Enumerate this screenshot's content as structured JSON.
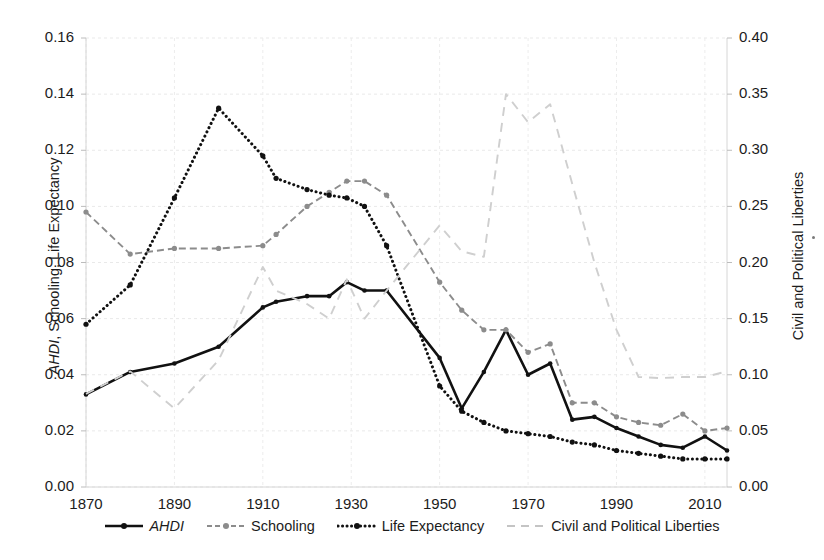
{
  "chart_data": {
    "type": "line",
    "title": "",
    "subtitle": "",
    "xlabel": "",
    "ylabel": "AHDI, Schooling, Life Expectancy",
    "y2label": "Civil and Political Liberties",
    "xlim": [
      1870,
      2015
    ],
    "ylim": [
      0.0,
      0.16
    ],
    "y2lim": [
      0.0,
      0.4
    ],
    "grid": true,
    "legend_position": "bottom",
    "x_ticks": [
      "1870",
      "1890",
      "1910",
      "1930",
      "1950",
      "1970",
      "1990",
      "2010"
    ],
    "x_tick_values": [
      1870,
      1890,
      1910,
      1930,
      1950,
      1970,
      1990,
      2010
    ],
    "y_ticks": [
      "0.00",
      "0.02",
      "0.04",
      "0.06",
      "0.08",
      "0.10",
      "0.12",
      "0.14",
      "0.16"
    ],
    "y_tick_values": [
      0.0,
      0.02,
      0.04,
      0.06,
      0.08,
      0.1,
      0.12,
      0.14,
      0.16
    ],
    "y2_ticks": [
      "0.00",
      "0.05",
      "0.10",
      "0.15",
      "0.20",
      "0.25",
      "0.30",
      "0.35",
      "0.40"
    ],
    "y2_tick_values": [
      0.0,
      0.05,
      0.1,
      0.15,
      0.2,
      0.25,
      0.3,
      0.35,
      0.4
    ],
    "x": [
      1870,
      1880,
      1890,
      1900,
      1910,
      1913,
      1920,
      1925,
      1929,
      1933,
      1938,
      1950,
      1955,
      1960,
      1965,
      1970,
      1975,
      1980,
      1985,
      1990,
      1995,
      2000,
      2005,
      2010,
      2015
    ],
    "series": [
      {
        "name": "AHDI",
        "axis": "left",
        "color": "#111111",
        "style": "solid",
        "markers": true,
        "values": [
          0.033,
          0.041,
          0.044,
          0.05,
          0.064,
          0.066,
          0.068,
          0.068,
          0.073,
          0.07,
          0.07,
          0.046,
          0.028,
          0.041,
          0.056,
          0.04,
          0.044,
          0.024,
          0.025,
          0.021,
          0.018,
          0.015,
          0.014,
          0.018,
          0.013
        ]
      },
      {
        "name": "Schooling",
        "axis": "left",
        "color": "#8c8c8c",
        "style": "dashed",
        "markers": true,
        "values": [
          0.098,
          0.083,
          0.085,
          0.085,
          0.086,
          0.09,
          0.1,
          0.105,
          0.109,
          0.109,
          0.104,
          0.073,
          0.063,
          0.056,
          0.056,
          0.048,
          0.051,
          0.03,
          0.03,
          0.025,
          0.023,
          0.022,
          0.026,
          0.02,
          0.021
        ]
      },
      {
        "name": "Life Expectancy",
        "axis": "left",
        "color": "#111111",
        "style": "dotted",
        "markers": true,
        "values": [
          0.058,
          0.072,
          0.103,
          0.135,
          0.118,
          0.11,
          0.106,
          0.104,
          0.103,
          0.1,
          0.086,
          0.036,
          0.027,
          0.023,
          0.02,
          0.019,
          0.018,
          0.016,
          0.015,
          0.013,
          0.012,
          0.011,
          0.01,
          0.01,
          0.01
        ]
      },
      {
        "name": "Civil and Political Liberties",
        "axis": "right",
        "color": "#cfcfcf",
        "style": "dashed-long",
        "markers": false,
        "values": [
          0.083,
          0.103,
          0.07,
          0.113,
          0.196,
          0.175,
          0.163,
          0.15,
          0.185,
          0.15,
          0.175,
          0.233,
          0.21,
          0.205,
          0.35,
          0.325,
          0.341,
          0.27,
          0.2,
          0.14,
          0.098,
          0.097,
          0.098,
          0.098,
          0.103
        ]
      }
    ]
  },
  "legend": {
    "items": [
      {
        "label": "AHDI",
        "italic": true,
        "style": "solid-marker",
        "color": "#111111"
      },
      {
        "label": "Schooling",
        "italic": false,
        "style": "dashed-marker",
        "color": "#8c8c8c"
      },
      {
        "label": "Life Expectancy",
        "italic": false,
        "style": "dotted-marker",
        "color": "#111111"
      },
      {
        "label": "Civil and Political Liberties",
        "italic": false,
        "style": "dashed-plain",
        "color": "#c4c4c4"
      }
    ]
  },
  "axes": {
    "left_title_part1": "AHDI",
    "left_title_part2": ", Schooling, Life Expectancy",
    "right_title": "Civil and Political Liberties"
  }
}
